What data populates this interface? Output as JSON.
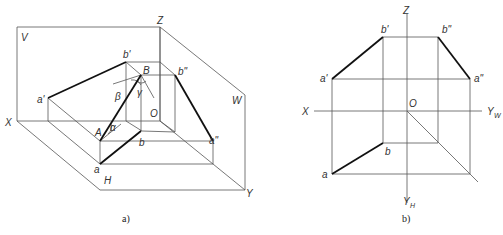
{
  "figure_a": {
    "caption": "a)",
    "labels": {
      "V": "V",
      "H": "H",
      "W": "W",
      "X": "X",
      "Y": "Y",
      "Z": "Z",
      "O": "O",
      "A": "A",
      "B": "B",
      "a": "a",
      "a_prime": "a'",
      "a_dprime": "a\"",
      "b": "b",
      "b_prime": "b'",
      "b_dprime": "b\"",
      "alpha": "α",
      "beta": "β",
      "gamma": "γ"
    }
  },
  "figure_b": {
    "caption": "b)",
    "labels": {
      "X": "X",
      "Z": "Z",
      "O": "O",
      "Y": "Y",
      "Y_W_sub": "W",
      "Y_H_sub": "H",
      "a": "a",
      "a_prime": "a'",
      "a_dprime": "a\"",
      "b": "b",
      "b_prime": "b'",
      "b_dprime": "b\""
    }
  }
}
